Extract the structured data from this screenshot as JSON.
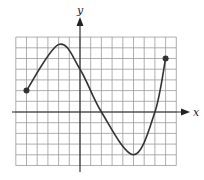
{
  "chart_data": {
    "type": "line",
    "title": "",
    "xlabel": "x",
    "ylabel": "y",
    "grid": true,
    "xlim": [
      -6,
      9
    ],
    "ylim": [
      -5,
      7
    ],
    "tick_labels": false,
    "series": [
      {
        "name": "f(x)",
        "points": [
          {
            "x": -5,
            "y": 2
          },
          {
            "x": -2,
            "y": 6.3
          },
          {
            "x": 0,
            "y": 4
          },
          {
            "x": 2,
            "y": 0
          },
          {
            "x": 5,
            "y": -4
          },
          {
            "x": 7,
            "y": 0
          },
          {
            "x": 8,
            "y": 5
          }
        ],
        "endpoints": [
          {
            "x": -5,
            "y": 2,
            "closed": true
          },
          {
            "x": 8,
            "y": 5,
            "closed": true
          }
        ]
      }
    ],
    "colors": {
      "curve": "#333333",
      "grid": "#9a9a9a",
      "axis": "#222222"
    }
  },
  "labels": {
    "x_axis": "x",
    "y_axis": "y"
  }
}
